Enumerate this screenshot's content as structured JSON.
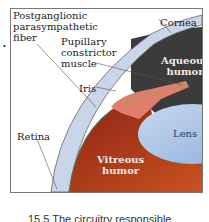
{
  "figure": {
    "labels": {
      "postganglionic": "Postganglionic parasympathetic fiber",
      "postganglionic_lines": [
        "Postganglionic",
        "parasympathetic",
        "fiber"
      ],
      "cornea": "Cornea",
      "pupillary_lines": [
        "Pupillary",
        "constrictor",
        "muscle"
      ],
      "aqueous_lines": [
        "Aqueous",
        "humor"
      ],
      "iris": "Iris",
      "lens": "Lens",
      "retina": "Retina",
      "vitreous_lines": [
        "Vitreous",
        "humor"
      ]
    },
    "colors": {
      "vitreous": "#a8341c",
      "aqueous": "#3a3a3a",
      "lens": "#a9c3e6",
      "sclera": "#c9d6ea",
      "iris": "#e58a7a"
    },
    "caption": "15.5 The circuitry responsible"
  }
}
